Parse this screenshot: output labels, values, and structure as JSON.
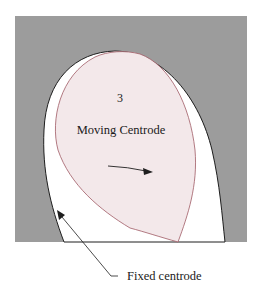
{
  "diagram": {
    "type": "centrode-diagram",
    "colors": {
      "background": "#ffffff",
      "fixed_body": "#9c9c9c",
      "fixed_centrode_region": "#ffffff",
      "moving_centrode_fill": "#f3e8ea",
      "moving_centrode_stroke": "#a05a64",
      "line": "#1e1e1e"
    },
    "labels": {
      "body_number": "3",
      "moving_centrode": "Moving Centrode",
      "fixed_centrode": "Fixed centrode"
    },
    "icons": {
      "rotation_arrow": "curved-arrow-right",
      "leader_arrow": "arrow-up-left"
    }
  }
}
